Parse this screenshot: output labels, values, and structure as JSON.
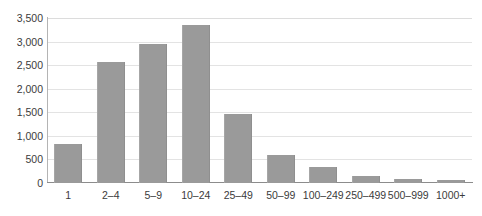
{
  "chart_data": {
    "type": "bar",
    "title": "",
    "subtitle": "",
    "xlabel": "",
    "ylabel": "",
    "categories": [
      "1",
      "2–4",
      "5–9",
      "10–24",
      "25–49",
      "50–99",
      "100–249",
      "250–499",
      "500–999",
      "1000+"
    ],
    "values": [
      820,
      2570,
      2950,
      3350,
      1460,
      590,
      330,
      140,
      70,
      60
    ],
    "ylim": [
      0,
      3500
    ],
    "yticks": [
      0,
      500,
      1000,
      1500,
      2000,
      2500,
      3000,
      3500
    ],
    "ytick_labels": [
      "0",
      "500",
      "1,000",
      "1,500",
      "2,000",
      "2,500",
      "3,000",
      "3,500"
    ],
    "grid": true,
    "legend": null,
    "bar_color": "#9a9a9a",
    "gridline_color": "#e3e3e3",
    "axis_color": "#8c8c8c",
    "text_color": "#3b3b3b"
  }
}
